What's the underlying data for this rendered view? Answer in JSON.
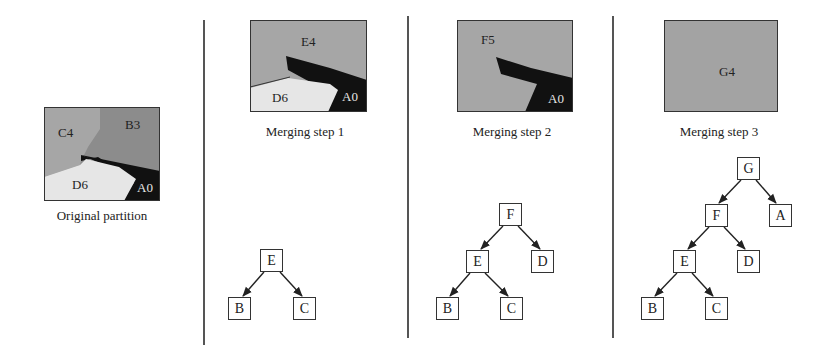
{
  "colors": {
    "region_light_gray": "#a6a6a6",
    "region_mid_gray": "#8c8c8c",
    "region_white": "#e6e6e6",
    "region_black": "#111111",
    "merged_gray": "#a3a3a3",
    "border": "#333333"
  },
  "panels": [
    {
      "id": "original",
      "caption": "Original partition",
      "regions": [
        {
          "label": "C4"
        },
        {
          "label": "B3"
        },
        {
          "label": "D6"
        },
        {
          "label": "A0"
        }
      ],
      "tree": []
    },
    {
      "id": "step1",
      "caption": "Merging step 1",
      "regions": [
        {
          "label": "E4"
        },
        {
          "label": "D6"
        },
        {
          "label": "A0"
        }
      ],
      "tree": [
        {
          "label": "E"
        },
        {
          "label": "B"
        },
        {
          "label": "C"
        }
      ]
    },
    {
      "id": "step2",
      "caption": "Merging step 2",
      "regions": [
        {
          "label": "F5"
        },
        {
          "label": "A0"
        }
      ],
      "tree": [
        {
          "label": "F"
        },
        {
          "label": "E"
        },
        {
          "label": "D"
        },
        {
          "label": "B"
        },
        {
          "label": "C"
        }
      ]
    },
    {
      "id": "step3",
      "caption": "Merging step 3",
      "regions": [
        {
          "label": "G4"
        }
      ],
      "tree": [
        {
          "label": "G"
        },
        {
          "label": "F"
        },
        {
          "label": "A"
        },
        {
          "label": "E"
        },
        {
          "label": "D"
        },
        {
          "label": "B"
        },
        {
          "label": "C"
        }
      ]
    }
  ]
}
